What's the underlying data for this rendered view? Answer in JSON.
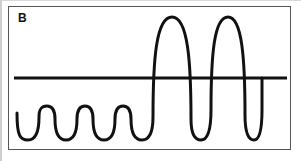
{
  "figure": {
    "panel_label": "B",
    "border_color": "#555555",
    "background_color": "#ffffff",
    "trace_color": "#111111",
    "baseline_color": "#111111"
  },
  "chart_data": {
    "type": "line",
    "title": "",
    "xlabel": "",
    "ylabel": "",
    "grid": false,
    "legend": null,
    "annotations": [
      {
        "text": "B",
        "x": 18,
        "y": 12,
        "role": "panel-label"
      }
    ],
    "xlim": [
      8,
      291
    ],
    "ylim": [
      6,
      150
    ],
    "baseline": {
      "name": "baseline",
      "y": 78,
      "x_start": 14,
      "x_end": 287,
      "stroke_width": 3
    },
    "series": [
      {
        "name": "waveform",
        "stroke_width": 3,
        "segments": [
          {
            "name": "low-amplitude-oscillations",
            "cycles": 6,
            "peak_y": 106,
            "trough_y": 140,
            "x_start": 17,
            "x_end": 152,
            "amplitude": 34,
            "period": 23
          },
          {
            "name": "high-amplitude-oscillations",
            "cycles": 3,
            "peak_y": 17,
            "trough_y": 140,
            "x_start": 152,
            "x_end": 262,
            "amplitude": 123,
            "period": 38,
            "peak_centers_x": [
              172,
              212,
              250
            ]
          }
        ]
      }
    ]
  }
}
